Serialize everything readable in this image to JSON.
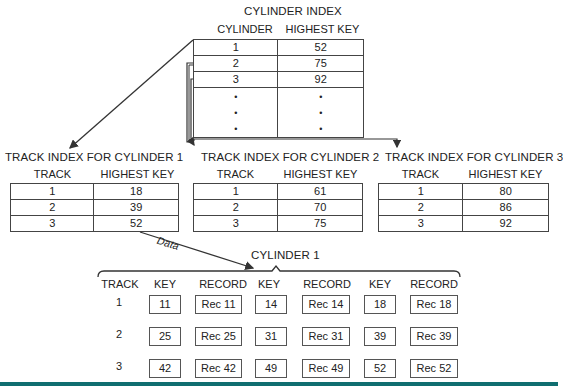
{
  "cylinder_index": {
    "title": "CYLINDER INDEX",
    "headers": [
      "CYLINDER",
      "HIGHEST KEY"
    ],
    "rows": [
      {
        "cylinder": "1",
        "highest_key": "52"
      },
      {
        "cylinder": "2",
        "highest_key": "75"
      },
      {
        "cylinder": "3",
        "highest_key": "92"
      }
    ],
    "ellipsis": "•"
  },
  "track_indexes": [
    {
      "title": "TRACK INDEX FOR CYLINDER 1",
      "headers": [
        "TRACK",
        "HIGHEST KEY"
      ],
      "rows": [
        {
          "track": "1",
          "highest_key": "18"
        },
        {
          "track": "2",
          "highest_key": "39"
        },
        {
          "track": "3",
          "highest_key": "52"
        }
      ]
    },
    {
      "title": "TRACK INDEX FOR CYLINDER 2",
      "headers": [
        "TRACK",
        "HIGHEST KEY"
      ],
      "rows": [
        {
          "track": "1",
          "highest_key": "61"
        },
        {
          "track": "2",
          "highest_key": "70"
        },
        {
          "track": "3",
          "highest_key": "75"
        }
      ]
    },
    {
      "title": "TRACK INDEX FOR CYLINDER 3",
      "headers": [
        "TRACK",
        "HIGHEST KEY"
      ],
      "rows": [
        {
          "track": "1",
          "highest_key": "80"
        },
        {
          "track": "2",
          "highest_key": "86"
        },
        {
          "track": "3",
          "highest_key": "92"
        }
      ]
    }
  ],
  "data_arrow_label": "Data",
  "cylinder_1": {
    "title": "CYLINDER 1",
    "headers": [
      "TRACK",
      "KEY",
      "RECORD",
      "KEY",
      "RECORD",
      "KEY",
      "RECORD"
    ],
    "tracks": [
      {
        "track": "1",
        "keys": [
          "11",
          "14",
          "18"
        ],
        "records": [
          "Rec 11",
          "Rec 14",
          "Rec 18"
        ]
      },
      {
        "track": "2",
        "keys": [
          "25",
          "31",
          "39"
        ],
        "records": [
          "Rec 25",
          "Rec 31",
          "Rec 39"
        ]
      },
      {
        "track": "3",
        "keys": [
          "42",
          "49",
          "52"
        ],
        "records": [
          "Rec 42",
          "Rec 49",
          "Rec 52"
        ]
      }
    ]
  },
  "colors": {
    "line": "#333333",
    "bottom_bar": "#0f6e70"
  }
}
